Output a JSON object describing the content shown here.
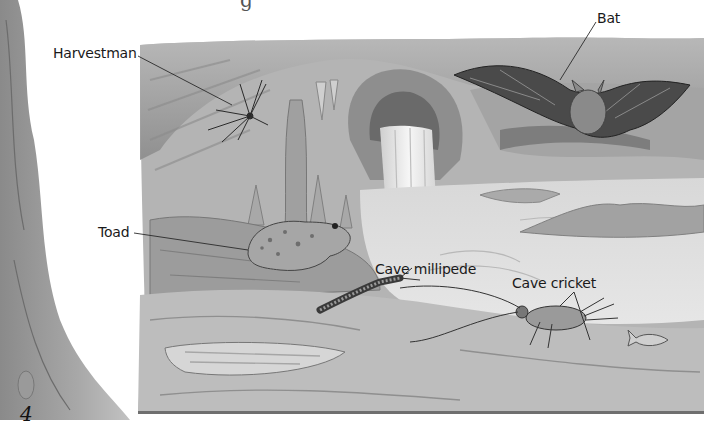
{
  "page": {
    "cropped_heading_fragment": "g",
    "page_number": "4"
  },
  "illustration": {
    "subject": "cave scene",
    "style": "grayscale pencil illustration",
    "labels": [
      {
        "id": "harvestman",
        "text": "Harvestman"
      },
      {
        "id": "bat",
        "text": "Bat"
      },
      {
        "id": "toad",
        "text": "Toad"
      },
      {
        "id": "cave-millipede",
        "text": "Cave millipede"
      },
      {
        "id": "cave-cricket",
        "text": "Cave cricket"
      }
    ]
  },
  "colors": {
    "paper": "#ffffff",
    "rock_dark": "#5a5a5a",
    "rock_mid": "#9a9a9a",
    "rock_light": "#c8c8c8",
    "water": "#dcdcdc",
    "rule": "#6f6f6f",
    "text": "#1a1a1a"
  }
}
